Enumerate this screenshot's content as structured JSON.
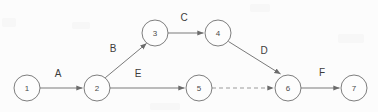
{
  "diagram": {
    "type": "directed-network-graph",
    "title": "",
    "background_color": "#fcfcfc",
    "node_stroke_color": "#6f6f6f",
    "edge_color": "#7a7a7a",
    "dashed_edge_color": "#9a9a9a",
    "label_color": "#3c3c3c",
    "node_radius": 13,
    "nodes": [
      {
        "id": "1",
        "label": "1",
        "cx": 27,
        "cy": 88
      },
      {
        "id": "2",
        "label": "2",
        "cx": 97,
        "cy": 88
      },
      {
        "id": "3",
        "label": "3",
        "cx": 155,
        "cy": 33
      },
      {
        "id": "4",
        "label": "4",
        "cx": 218,
        "cy": 33
      },
      {
        "id": "5",
        "label": "5",
        "cx": 199,
        "cy": 88
      },
      {
        "id": "6",
        "label": "6",
        "cx": 288,
        "cy": 88
      },
      {
        "id": "7",
        "label": "7",
        "cx": 354,
        "cy": 88
      }
    ],
    "edges": [
      {
        "id": "A",
        "label": "A",
        "from": "1",
        "to": "2",
        "style": "solid",
        "arrow": true,
        "label_x": 58,
        "label_y": 73
      },
      {
        "id": "B",
        "label": "B",
        "from": "2",
        "to": "3",
        "style": "solid",
        "arrow": true,
        "label_x": 113,
        "label_y": 48
      },
      {
        "id": "C",
        "label": "C",
        "from": "3",
        "to": "4",
        "style": "solid",
        "arrow": true,
        "label_x": 184,
        "label_y": 17
      },
      {
        "id": "D",
        "label": "D",
        "from": "4",
        "to": "6",
        "style": "solid",
        "arrow": true,
        "label_x": 264,
        "label_y": 50
      },
      {
        "id": "E",
        "label": "E",
        "from": "2",
        "to": "5",
        "style": "solid",
        "arrow": true,
        "label_x": 138,
        "label_y": 73
      },
      {
        "id": "DUMMY",
        "label": "",
        "from": "5",
        "to": "6",
        "style": "dashed",
        "arrow": true,
        "label_x": 0,
        "label_y": 0
      },
      {
        "id": "F",
        "label": "F",
        "from": "6",
        "to": "7",
        "style": "solid",
        "arrow": true,
        "label_x": 322,
        "label_y": 72
      }
    ]
  }
}
